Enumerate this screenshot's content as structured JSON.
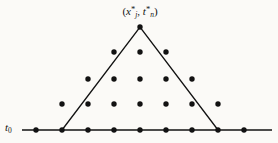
{
  "figure": {
    "kind": "domain-of-dependence-stencil",
    "width": 278,
    "height": 143,
    "background_color": "#fbfaf7",
    "ink_color": "#121212"
  },
  "labels": {
    "initial_time": {
      "text": "t0",
      "base": "t",
      "subscript": "0",
      "x": 5,
      "y": 122
    },
    "apex_point": {
      "text": "(x*j, t*n)",
      "open_paren": "(",
      "first_var": "x",
      "first_star": "*",
      "first_sub": "j",
      "comma": ", ",
      "second_var": "t",
      "second_star": "*",
      "second_sub": "n",
      "close_paren": ")",
      "x": 140,
      "y": 5
    }
  },
  "axis": {
    "baseline": {
      "x1": 22,
      "y1": 130,
      "x2": 272,
      "y2": 130,
      "stroke_width": 1.6,
      "color": "#121212"
    }
  },
  "triangle": {
    "apex": {
      "x": 140,
      "y": 27
    },
    "left_base": {
      "x": 62,
      "y": 130
    },
    "right_base": {
      "x": 218,
      "y": 130
    },
    "stroke_width": 1.3,
    "color": "#121212",
    "fill": "none"
  },
  "lattice": {
    "dot_radius": 2.7,
    "dot_color": "#121212",
    "x_spacing": 26,
    "y_spacing": 25.75,
    "rows": [
      {
        "index": 0,
        "y": 130,
        "count": 9,
        "xs": [
          36,
          62,
          88,
          114,
          140,
          166,
          192,
          218,
          244
        ]
      },
      {
        "index": 1,
        "y": 104,
        "count": 7,
        "xs": [
          62,
          88,
          114,
          140,
          166,
          192,
          218
        ]
      },
      {
        "index": 2,
        "y": 79,
        "count": 5,
        "xs": [
          88,
          114,
          140,
          166,
          192
        ]
      },
      {
        "index": 3,
        "y": 52,
        "count": 3,
        "xs": [
          114,
          140,
          166
        ]
      },
      {
        "index": 4,
        "y": 27,
        "count": 1,
        "xs": [
          140
        ]
      }
    ]
  },
  "chart_data": {
    "type": "scatter",
    "title": "",
    "xlabel": "",
    "ylabel": "",
    "grid": false,
    "legend": null,
    "xlim": [
      22,
      272
    ],
    "ylim": [
      130,
      27
    ],
    "annotations": [
      {
        "text": "t0",
        "x": 5,
        "y": 130
      },
      {
        "text": "(x*j, t*n)",
        "x": 140,
        "y": 18
      }
    ],
    "series": [
      {
        "name": "stencil-points",
        "x": [
          36,
          62,
          88,
          114,
          140,
          166,
          192,
          218,
          244,
          62,
          88,
          114,
          140,
          166,
          192,
          218,
          88,
          114,
          140,
          166,
          192,
          114,
          140,
          166,
          140
        ],
        "y": [
          130,
          130,
          130,
          130,
          130,
          130,
          130,
          130,
          130,
          104,
          104,
          104,
          104,
          104,
          104,
          104,
          79,
          79,
          79,
          79,
          79,
          52,
          52,
          52,
          27
        ]
      }
    ],
    "shapes": [
      {
        "type": "line",
        "points": [
          [
            22,
            130
          ],
          [
            272,
            130
          ]
        ]
      },
      {
        "type": "polyline",
        "points": [
          [
            62,
            130
          ],
          [
            140,
            27
          ],
          [
            218,
            130
          ]
        ]
      }
    ]
  }
}
